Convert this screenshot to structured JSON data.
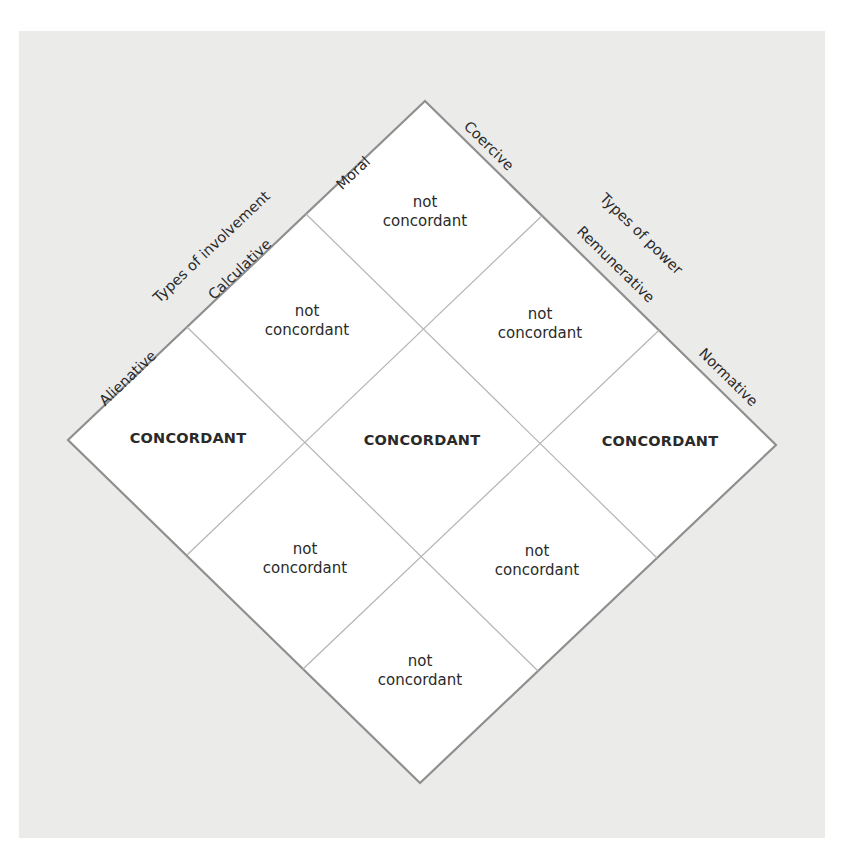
{
  "colors": {
    "panel_background": "#ebebea",
    "diamond_fill": "#ffffff",
    "outer_border": "#8f8f8f",
    "inner_lines": "#b4b4b4",
    "text": "#2a2a2a"
  },
  "axes": {
    "involvement": {
      "title": "Types of involvement",
      "levels": [
        "Moral",
        "Calculative",
        "Alienative"
      ]
    },
    "power": {
      "title": "Types of power",
      "levels": [
        "Coercive",
        "Remunerative",
        "Normative"
      ]
    }
  },
  "cells": {
    "top": {
      "line1": "not",
      "line2": "concordant",
      "power": "Coercive",
      "involvement": "Moral"
    },
    "upper_left": {
      "line1": "not",
      "line2": "concordant",
      "power": "Coercive",
      "involvement": "Calculative"
    },
    "upper_right": {
      "line1": "not",
      "line2": "concordant",
      "power": "Remunerative",
      "involvement": "Moral"
    },
    "left": {
      "label": "CONCORDANT",
      "power": "Coercive",
      "involvement": "Alienative"
    },
    "center": {
      "label": "CONCORDANT",
      "power": "Remunerative",
      "involvement": "Calculative"
    },
    "right": {
      "label": "CONCORDANT",
      "power": "Normative",
      "involvement": "Moral"
    },
    "lower_left": {
      "line1": "not",
      "line2": "concordant",
      "power": "Remunerative",
      "involvement": "Alienative"
    },
    "lower_right": {
      "line1": "not",
      "line2": "concordant",
      "power": "Normative",
      "involvement": "Calculative"
    },
    "bottom": {
      "line1": "not",
      "line2": "concordant",
      "power": "Normative",
      "involvement": "Alienative"
    }
  }
}
